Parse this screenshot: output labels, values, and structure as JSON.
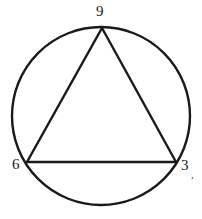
{
  "figure": {
    "background_color": "#ffffff",
    "stroke_color": "#1a1a1a",
    "label_color": "#1a1a1a",
    "width": 202,
    "height": 219
  },
  "circle": {
    "name": "circumscribed-circle",
    "cx": 101,
    "cy": 116,
    "r": 89,
    "stroke_width": 2.4,
    "fill": "none"
  },
  "triangle": {
    "name": "inscribed-triangle",
    "stroke_width": 2.4,
    "fill": "none",
    "points": "102,28 176,162 27,162",
    "vertices": [
      {
        "id": "top",
        "label": "9",
        "x": 102,
        "y": 28
      },
      {
        "id": "bottom-right",
        "label": "3",
        "x": 176,
        "y": 162
      },
      {
        "id": "bottom-left",
        "label": "6",
        "x": 27,
        "y": 162
      }
    ]
  },
  "labels": {
    "top": "9",
    "bottom_left": "6",
    "bottom_right": "3",
    "artifact": ","
  },
  "chart_data": {
    "type": "diagram",
    "shapes": [
      "circle",
      "triangle"
    ],
    "categories": [
      "9",
      "6",
      "3"
    ],
    "values": [
      9,
      6,
      3
    ],
    "annotations": [
      {
        "text": "9",
        "position": "top",
        "x": 102,
        "y": 12
      },
      {
        "text": "6",
        "position": "bottom-left",
        "x": 18,
        "y": 165
      },
      {
        "text": "3",
        "position": "bottom-right",
        "x": 186,
        "y": 166
      }
    ],
    "xlabel": "",
    "ylabel": "",
    "grid": false,
    "legend": "none"
  }
}
